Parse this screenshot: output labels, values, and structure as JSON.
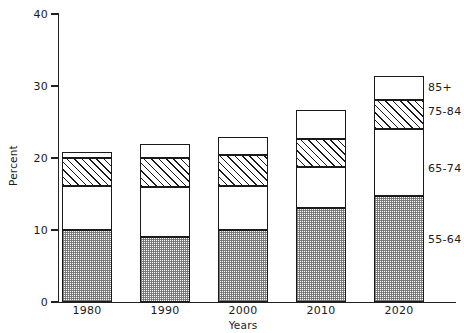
{
  "chart_data": {
    "type": "bar",
    "subtype": "stacked-bar",
    "title": "",
    "xlabel": "Years",
    "ylabel": "Percent",
    "categories": [
      "1980",
      "1990",
      "2000",
      "2010",
      "2020"
    ],
    "ylim": [
      0,
      40
    ],
    "yticks": [
      0,
      10,
      20,
      30,
      40
    ],
    "ytick_labels": [
      "0",
      "10",
      "20",
      "30",
      "40"
    ],
    "grid": false,
    "legend_position": "right-inline",
    "series": [
      {
        "name": "55-64",
        "values": [
          10.0,
          9.0,
          10.0,
          13.0,
          14.7
        ]
      },
      {
        "name": "65-74",
        "values": [
          6.1,
          7.0,
          6.1,
          5.8,
          9.3
        ]
      },
      {
        "name": "75-84",
        "values": [
          3.9,
          4.0,
          4.3,
          3.8,
          4.0
        ]
      },
      {
        "name": "85+",
        "values": [
          0.9,
          2.0,
          2.5,
          4.0,
          3.4
        ]
      }
    ],
    "totals": [
      20.9,
      22.0,
      22.9,
      26.6,
      31.4
    ],
    "legend_entries": [
      "85+",
      "75-84",
      "65-74",
      "55-64"
    ]
  },
  "axes": {
    "y_title": "Percent",
    "x_title": "Years"
  },
  "colors": {
    "axis": "#222222",
    "outline": "#1a1a1a",
    "background": "#ffffff",
    "stipple": "#6e6e6e"
  }
}
